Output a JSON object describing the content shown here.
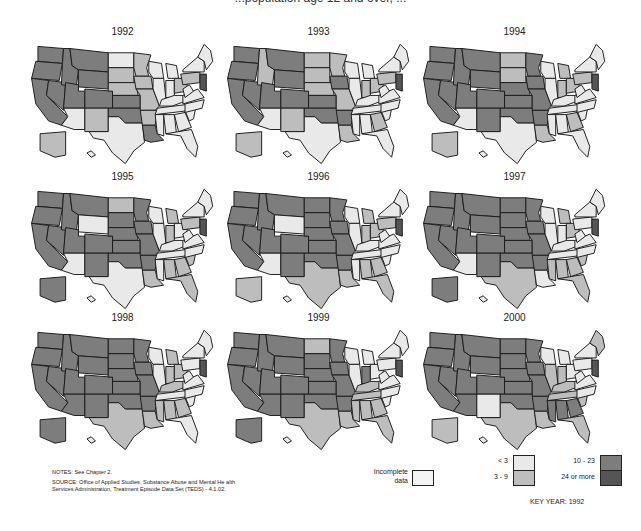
{
  "figure": {
    "title_fragment": "...population age 12 and over, ...",
    "colors": {
      "lt3": "#e9e9e9",
      "3to9": "#bdbdbd",
      "10to23": "#7d7d7d",
      "24plus": "#555555",
      "incomplete": "#f4f4f4",
      "stroke": "#1a1a1a"
    }
  },
  "panels": [
    {
      "year": "1992"
    },
    {
      "year": "1993"
    },
    {
      "year": "1994"
    },
    {
      "year": "1995"
    },
    {
      "year": "1996"
    },
    {
      "year": "1997"
    },
    {
      "year": "1998"
    },
    {
      "year": "1999"
    },
    {
      "year": "2000"
    }
  ],
  "notes": {
    "notes_line": "NOTES: See Chapter 2.",
    "source_line1": "SOURCE: Office of Applied Studies, Substance Abuse and Mental He alth",
    "source_line2": "Services Administration, Treatment Episode Data Set (TEDS) - 4.1.02."
  },
  "legend": {
    "incomplete_label_1": "Incomplete",
    "incomplete_label_2": "data",
    "items": [
      {
        "label": "< 3",
        "key": "lt3"
      },
      {
        "label": "3 - 9",
        "key": "3to9"
      },
      {
        "label": "10 - 23",
        "key": "10to23"
      },
      {
        "label": "24 or more",
        "key": "24plus"
      }
    ],
    "key_year": "KEY YEAR: 1992"
  },
  "map_data": {
    "type": "choropleth",
    "regions": [
      "WA",
      "OR",
      "CA",
      "NV",
      "ID",
      "MT",
      "WY",
      "UT",
      "CO",
      "AZ",
      "NM",
      "ND",
      "SD",
      "NE",
      "KS",
      "OK",
      "TX",
      "MN",
      "IA",
      "MO",
      "AR",
      "LA",
      "WI",
      "IL",
      "MI",
      "IN",
      "OH",
      "KY",
      "TN",
      "MS",
      "AL",
      "GA",
      "FL",
      "SC",
      "NC",
      "VA",
      "WV",
      "PA",
      "NY",
      "NE_states",
      "MD_DE_NJ",
      "AK",
      "HI"
    ],
    "bins": [
      "lt3",
      "3to9",
      "10to23",
      "24plus"
    ],
    "by_year": {
      "1992": {
        "WA": "10to23",
        "OR": "10to23",
        "CA": "10to23",
        "NV": "10to23",
        "ID": "10to23",
        "MT": "10to23",
        "WY": "10to23",
        "UT": "10to23",
        "CO": "10to23",
        "AZ": "lt3",
        "NM": "3to9",
        "ND": "lt3",
        "SD": "3to9",
        "NE": "3to9",
        "KS": "10to23",
        "OK": "10to23",
        "TX": "lt3",
        "MN": "3to9",
        "IA": "3to9",
        "MO": "3to9",
        "AR": "3to9",
        "LA": "10to23",
        "WI": "lt3",
        "IL": "lt3",
        "MI": "lt3",
        "IN": "lt3",
        "OH": "3to9",
        "KY": "lt3",
        "TN": "lt3",
        "MS": "lt3",
        "AL": "lt3",
        "GA": "lt3",
        "FL": "lt3",
        "SC": "lt3",
        "NC": "lt3",
        "VA": "lt3",
        "WV": "lt3",
        "PA": "3to9",
        "NY": "lt3",
        "NE_states": "lt3",
        "MD_DE_NJ": "24plus",
        "AK": "3to9",
        "HI": "lt3"
      },
      "1993": {
        "WA": "10to23",
        "OR": "10to23",
        "CA": "10to23",
        "NV": "10to23",
        "ID": "3to9",
        "MT": "10to23",
        "WY": "10to23",
        "UT": "10to23",
        "CO": "10to23",
        "AZ": "lt3",
        "NM": "3to9",
        "ND": "3to9",
        "SD": "3to9",
        "NE": "3to9",
        "KS": "10to23",
        "OK": "10to23",
        "TX": "lt3",
        "MN": "3to9",
        "IA": "10to23",
        "MO": "3to9",
        "AR": "10to23",
        "LA": "3to9",
        "WI": "lt3",
        "IL": "lt3",
        "MI": "lt3",
        "IN": "3to9",
        "OH": "3to9",
        "KY": "lt3",
        "TN": "lt3",
        "MS": "lt3",
        "AL": "lt3",
        "GA": "3to9",
        "FL": "lt3",
        "SC": "lt3",
        "NC": "lt3",
        "VA": "lt3",
        "WV": "lt3",
        "PA": "3to9",
        "NY": "lt3",
        "NE_states": "lt3",
        "MD_DE_NJ": "24plus",
        "AK": "3to9",
        "HI": "lt3"
      },
      "1994": {
        "WA": "10to23",
        "OR": "10to23",
        "CA": "10to23",
        "NV": "10to23",
        "ID": "10to23",
        "MT": "10to23",
        "WY": "10to23",
        "UT": "10to23",
        "CO": "10to23",
        "AZ": "lt3",
        "NM": "10to23",
        "ND": "3to9",
        "SD": "3to9",
        "NE": "10to23",
        "KS": "10to23",
        "OK": "10to23",
        "TX": "lt3",
        "MN": "10to23",
        "IA": "10to23",
        "MO": "10to23",
        "AR": "10to23",
        "LA": "3to9",
        "WI": "lt3",
        "IL": "lt3",
        "MI": "3to9",
        "IN": "3to9",
        "OH": "3to9",
        "KY": "lt3",
        "TN": "lt3",
        "MS": "lt3",
        "AL": "lt3",
        "GA": "3to9",
        "FL": "lt3",
        "SC": "lt3",
        "NC": "lt3",
        "VA": "lt3",
        "WV": "lt3",
        "PA": "3to9",
        "NY": "lt3",
        "NE_states": "lt3",
        "MD_DE_NJ": "24plus",
        "AK": "3to9",
        "HI": "lt3"
      },
      "1995": {
        "WA": "10to23",
        "OR": "10to23",
        "CA": "10to23",
        "NV": "10to23",
        "ID": "10to23",
        "MT": "10to23",
        "WY": "lt3",
        "UT": "10to23",
        "CO": "10to23",
        "AZ": "lt3",
        "NM": "10to23",
        "ND": "3to9",
        "SD": "10to23",
        "NE": "10to23",
        "KS": "10to23",
        "OK": "10to23",
        "TX": "lt3",
        "MN": "10to23",
        "IA": "10to23",
        "MO": "10to23",
        "AR": "10to23",
        "LA": "3to9",
        "WI": "lt3",
        "IL": "lt3",
        "MI": "3to9",
        "IN": "3to9",
        "OH": "lt3",
        "KY": "lt3",
        "TN": "lt3",
        "MS": "lt3",
        "AL": "3to9",
        "GA": "3to9",
        "FL": "3to9",
        "SC": "3to9",
        "NC": "lt3",
        "VA": "lt3",
        "WV": "lt3",
        "PA": "3to9",
        "NY": "lt3",
        "NE_states": "lt3",
        "MD_DE_NJ": "24plus",
        "AK": "10to23",
        "HI": "lt3"
      },
      "1996": {
        "WA": "10to23",
        "OR": "10to23",
        "CA": "10to23",
        "NV": "10to23",
        "ID": "10to23",
        "MT": "10to23",
        "WY": "lt3",
        "UT": "10to23",
        "CO": "10to23",
        "AZ": "lt3",
        "NM": "10to23",
        "ND": "10to23",
        "SD": "10to23",
        "NE": "10to23",
        "KS": "10to23",
        "OK": "10to23",
        "TX": "3to9",
        "MN": "10to23",
        "IA": "10to23",
        "MO": "10to23",
        "AR": "10to23",
        "LA": "3to9",
        "WI": "lt3",
        "IL": "lt3",
        "MI": "3to9",
        "IN": "3to9",
        "OH": "3to9",
        "KY": "lt3",
        "TN": "lt3",
        "MS": "lt3",
        "AL": "3to9",
        "GA": "3to9",
        "FL": "3to9",
        "SC": "lt3",
        "NC": "lt3",
        "VA": "lt3",
        "WV": "lt3",
        "PA": "3to9",
        "NY": "lt3",
        "NE_states": "lt3",
        "MD_DE_NJ": "24plus",
        "AK": "3to9",
        "HI": "lt3"
      },
      "1997": {
        "WA": "10to23",
        "OR": "10to23",
        "CA": "10to23",
        "NV": "10to23",
        "ID": "10to23",
        "MT": "10to23",
        "WY": "10to23",
        "UT": "10to23",
        "CO": "10to23",
        "AZ": "lt3",
        "NM": "10to23",
        "ND": "10to23",
        "SD": "10to23",
        "NE": "10to23",
        "KS": "10to23",
        "OK": "10to23",
        "TX": "3to9",
        "MN": "10to23",
        "IA": "10to23",
        "MO": "10to23",
        "AR": "10to23",
        "LA": "lt3",
        "WI": "lt3",
        "IL": "lt3",
        "MI": "3to9",
        "IN": "lt3",
        "OH": "3to9",
        "KY": "lt3",
        "TN": "lt3",
        "MS": "3to9",
        "AL": "3to9",
        "GA": "3to9",
        "FL": "3to9",
        "SC": "3to9",
        "NC": "lt3",
        "VA": "lt3",
        "WV": "lt3",
        "PA": "lt3",
        "NY": "lt3",
        "NE_states": "lt3",
        "MD_DE_NJ": "24plus",
        "AK": "10to23",
        "HI": "lt3"
      },
      "1998": {
        "WA": "10to23",
        "OR": "10to23",
        "CA": "10to23",
        "NV": "10to23",
        "ID": "10to23",
        "MT": "10to23",
        "WY": "10to23",
        "UT": "10to23",
        "CO": "10to23",
        "AZ": "10to23",
        "NM": "10to23",
        "ND": "10to23",
        "SD": "10to23",
        "NE": "10to23",
        "KS": "10to23",
        "OK": "10to23",
        "TX": "3to9",
        "MN": "10to23",
        "IA": "10to23",
        "MO": "10to23",
        "AR": "10to23",
        "LA": "3to9",
        "WI": "lt3",
        "IL": "lt3",
        "MI": "3to9",
        "IN": "3to9",
        "OH": "3to9",
        "KY": "3to9",
        "TN": "lt3",
        "MS": "3to9",
        "AL": "3to9",
        "GA": "3to9",
        "FL": "lt3",
        "SC": "lt3",
        "NC": "lt3",
        "VA": "lt3",
        "WV": "lt3",
        "PA": "lt3",
        "NY": "lt3",
        "NE_states": "lt3",
        "MD_DE_NJ": "24plus",
        "AK": "10to23",
        "HI": "lt3"
      },
      "1999": {
        "WA": "10to23",
        "OR": "10to23",
        "CA": "10to23",
        "NV": "10to23",
        "ID": "10to23",
        "MT": "10to23",
        "WY": "10to23",
        "UT": "10to23",
        "CO": "10to23",
        "AZ": "10to23",
        "NM": "10to23",
        "ND": "3to9",
        "SD": "10to23",
        "NE": "10to23",
        "KS": "10to23",
        "OK": "10to23",
        "TX": "3to9",
        "MN": "10to23",
        "IA": "10to23",
        "MO": "10to23",
        "AR": "10to23",
        "LA": "3to9",
        "WI": "lt3",
        "IL": "lt3",
        "MI": "lt3",
        "IN": "10to23",
        "OH": "lt3",
        "KY": "3to9",
        "TN": "3to9",
        "MS": "3to9",
        "AL": "3to9",
        "GA": "3to9",
        "FL": "3to9",
        "SC": "lt3",
        "NC": "lt3",
        "VA": "lt3",
        "WV": "lt3",
        "PA": "lt3",
        "NY": "lt3",
        "NE_states": "lt3",
        "MD_DE_NJ": "24plus",
        "AK": "10to23",
        "HI": "lt3"
      },
      "2000": {
        "WA": "10to23",
        "OR": "10to23",
        "CA": "10to23",
        "NV": "10to23",
        "ID": "10to23",
        "MT": "10to23",
        "WY": "10to23",
        "UT": "10to23",
        "CO": "10to23",
        "AZ": "10to23",
        "NM": "lt3",
        "ND": "10to23",
        "SD": "10to23",
        "NE": "10to23",
        "KS": "10to23",
        "OK": "10to23",
        "TX": "3to9",
        "MN": "10to23",
        "IA": "10to23",
        "MO": "10to23",
        "AR": "10to23",
        "LA": "3to9",
        "WI": "lt3",
        "IL": "3to9",
        "MI": "lt3",
        "IN": "3to9",
        "OH": "lt3",
        "KY": "3to9",
        "TN": "3to9",
        "MS": "10to23",
        "AL": "10to23",
        "GA": "10to23",
        "FL": "3to9",
        "SC": "3to9",
        "NC": "lt3",
        "VA": "lt3",
        "WV": "lt3",
        "PA": "lt3",
        "NY": "lt3",
        "NE_states": "3to9",
        "MD_DE_NJ": "24plus",
        "AK": "3to9",
        "HI": "lt3"
      }
    }
  }
}
